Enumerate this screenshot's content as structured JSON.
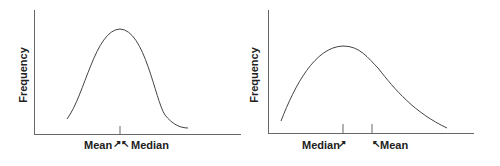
{
  "charts": [
    {
      "name": "symmetric-distribution",
      "ylabel": "Frequency",
      "markers": [
        {
          "label": "Mean",
          "arrow": "↗"
        },
        {
          "label": "Median",
          "arrow": "↖"
        }
      ]
    },
    {
      "name": "right-skewed-distribution",
      "ylabel": "Frequency",
      "markers": [
        {
          "label": "Median",
          "arrow": "↗"
        },
        {
          "label": "Mean",
          "arrow": "↖"
        }
      ]
    }
  ],
  "colors": {
    "line": "#333333",
    "axis": "#555555",
    "text": "#222222"
  }
}
